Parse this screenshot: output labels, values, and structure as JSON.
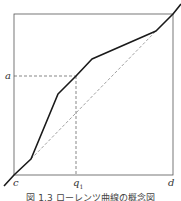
{
  "figure": {
    "caption": "図 1.3  ローレンツ曲線の概念図",
    "labels": {
      "y_point": "a",
      "origin": "c",
      "x_point": "q",
      "x_point_sub": "1",
      "x_end": "d"
    },
    "colors": {
      "frame": "#555555",
      "curve": "#1a1a1a",
      "dashed": "#666666"
    }
  },
  "diagram": {
    "frame": {
      "x0": 14,
      "y0": 14,
      "x1": 173,
      "y1": 175
    },
    "curve_points": [
      [
        4,
        186
      ],
      [
        14,
        175
      ],
      [
        31,
        159
      ],
      [
        58,
        94
      ],
      [
        76,
        76
      ],
      [
        92,
        59
      ],
      [
        156,
        31
      ],
      [
        173,
        14
      ],
      [
        181,
        4
      ]
    ],
    "dashed_chord": [
      [
        31,
        159
      ],
      [
        156,
        31
      ]
    ],
    "guide_h": [
      [
        14,
        76
      ],
      [
        76,
        76
      ]
    ],
    "guide_v": [
      [
        76,
        76
      ],
      [
        76,
        175
      ]
    ]
  }
}
